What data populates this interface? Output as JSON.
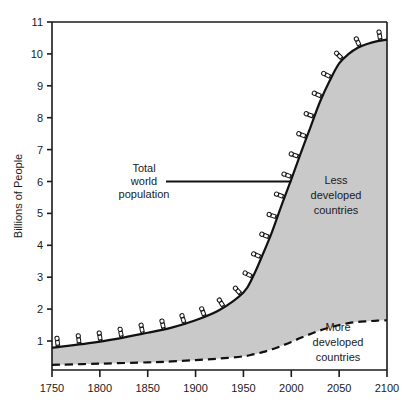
{
  "chart_data": {
    "type": "area",
    "title": "",
    "xlabel": "",
    "ylabel": "Billions of People",
    "xlim": [
      1750,
      2100
    ],
    "ylim": [
      0,
      11
    ],
    "grid": false,
    "legend_position": "inline-annotations",
    "x_ticks": [
      "1750",
      "1800",
      "1850",
      "1900",
      "1950",
      "2000",
      "2050",
      "2100"
    ],
    "y_ticks": [
      "1",
      "2",
      "3",
      "4",
      "5",
      "6",
      "7",
      "8",
      "9",
      "10",
      "11"
    ],
    "x": [
      1750,
      1800,
      1850,
      1875,
      1900,
      1925,
      1950,
      1960,
      1970,
      1980,
      1990,
      2000,
      2010,
      2020,
      2030,
      2040,
      2050,
      2060,
      2070,
      2080,
      2090,
      2100
    ],
    "series": [
      {
        "name": "Total world population",
        "style": "solid",
        "values": [
          0.79,
          0.98,
          1.26,
          1.42,
          1.65,
          1.97,
          2.52,
          3.02,
          3.7,
          4.43,
          5.27,
          6.07,
          6.9,
          7.7,
          8.5,
          9.15,
          9.7,
          10.0,
          10.2,
          10.32,
          10.4,
          10.45
        ]
      },
      {
        "name": "More developed countries",
        "style": "dashed",
        "values": [
          0.25,
          0.29,
          0.33,
          0.36,
          0.4,
          0.45,
          0.52,
          0.58,
          0.65,
          0.74,
          0.85,
          0.97,
          1.1,
          1.22,
          1.33,
          1.42,
          1.5,
          1.56,
          1.6,
          1.62,
          1.64,
          1.65
        ]
      }
    ],
    "fill_region": {
      "name": "Less developed countries",
      "between": [
        "More developed countries",
        "Total world population"
      ],
      "color": "#c9c9c9"
    },
    "annotations": [
      {
        "name": "total-world-population",
        "lines": [
          "Total",
          "world",
          "population"
        ],
        "leader_line": true,
        "points_to_year": 2000,
        "points_to_value": 6.0
      },
      {
        "name": "less-developed-countries",
        "lines": [
          "Less",
          "developed",
          "countries"
        ],
        "leader_line": false
      },
      {
        "name": "more-developed-countries",
        "lines": [
          "More",
          "developed",
          "countries"
        ],
        "leader_line": false
      }
    ],
    "markers": {
      "name": "person-icon",
      "description": "small human figures placed perpendicular along the total world population curve",
      "count": 24
    },
    "colors": {
      "line": "#111111",
      "fill": "#c9c9c9",
      "axis": "#1a1a1a",
      "background": "#ffffff"
    }
  }
}
